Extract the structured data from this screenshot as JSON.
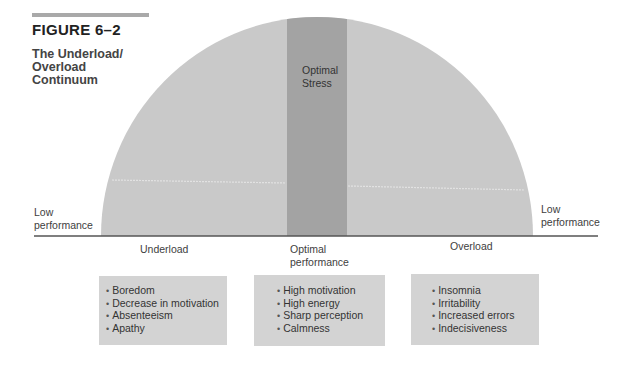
{
  "figure": {
    "label": "FIGURE 6–2",
    "title_lines": [
      "The Underload/",
      "Overload",
      "Continuum"
    ]
  },
  "diagram": {
    "center_band_label_lines": [
      "Optimal",
      "Stress"
    ],
    "left_end_label_lines": [
      "Low",
      "performance"
    ],
    "right_end_label_lines": [
      "Low",
      "performance"
    ],
    "axis_labels": {
      "left": "Underload",
      "center_lines": [
        "Optimal",
        "performance"
      ],
      "right": "Overload"
    },
    "colors": {
      "arc_fill": "#c9c9c9",
      "band_fill": "#a3a3a3",
      "box_fill": "#d3d3d3",
      "axis": "#555555"
    }
  },
  "boxes": [
    {
      "name": "underload-symptoms",
      "items": [
        "Boredom",
        "Decrease in motivation",
        "Absenteeism",
        "Apathy"
      ]
    },
    {
      "name": "optimal-symptoms",
      "items": [
        "High motivation",
        "High energy",
        "Sharp perception",
        "Calmness"
      ]
    },
    {
      "name": "overload-symptoms",
      "items": [
        "Insomnia",
        "Irritability",
        "Increased errors",
        "Indecisiveness"
      ]
    }
  ]
}
